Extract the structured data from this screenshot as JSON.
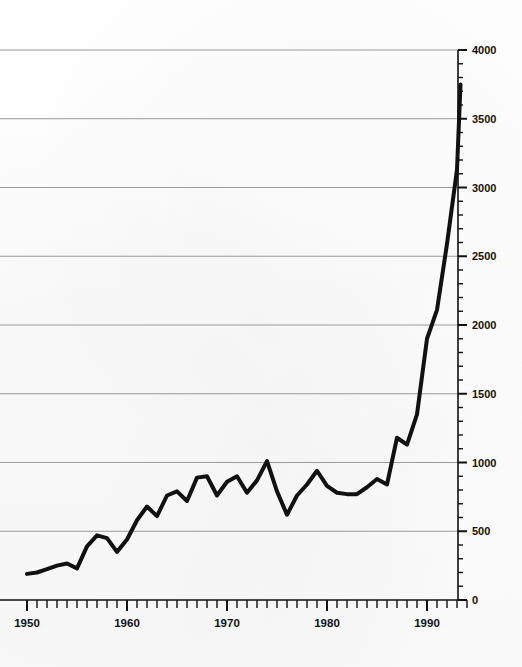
{
  "chart_data": {
    "type": "line",
    "title": "",
    "subtitle": "",
    "xlabel": "",
    "ylabel": "",
    "xlim": [
      1949.5,
      1994.5
    ],
    "ylim": [
      0,
      4000
    ],
    "grid": true,
    "legend": "none",
    "y_ticks_major": [
      0,
      500,
      1000,
      1500,
      2000,
      2500,
      3000,
      3500,
      4000
    ],
    "y_tick_labels": [
      "0",
      "500",
      "1000",
      "1500",
      "2000",
      "2500",
      "3000",
      "3500",
      "4000"
    ],
    "y_minor_step": 100,
    "x_ticks_major": [
      1950,
      1960,
      1970,
      1980,
      1990
    ],
    "x_tick_labels": [
      "1950",
      "1960",
      "1970",
      "1980",
      "1990"
    ],
    "x_minor_step": 1,
    "x_tick_range": [
      1950,
      1994
    ],
    "series": [
      {
        "name": "series-1",
        "color": "#111111",
        "line_width": 4,
        "x": [
          1950,
          1951,
          1952,
          1953,
          1954,
          1955,
          1956,
          1957,
          1958,
          1959,
          1960,
          1961,
          1962,
          1963,
          1964,
          1965,
          1966,
          1967,
          1968,
          1969,
          1970,
          1971,
          1972,
          1973,
          1974,
          1975,
          1976,
          1977,
          1978,
          1979,
          1980,
          1981,
          1982,
          1983,
          1984,
          1985,
          1986,
          1987,
          1988,
          1989,
          1990,
          1991,
          1992,
          1993
        ],
        "values": [
          190,
          200,
          225,
          250,
          265,
          230,
          390,
          470,
          450,
          350,
          440,
          580,
          680,
          610,
          760,
          790,
          720,
          890,
          900,
          760,
          860,
          900,
          780,
          870,
          1010,
          790,
          620,
          760,
          840,
          940,
          830,
          780,
          770,
          770,
          820,
          880,
          840,
          1180,
          1130,
          1350,
          1900,
          2110,
          2590,
          3130
        ]
      }
    ],
    "note_points": {
      "start": {
        "year": 1950,
        "value": 190
      },
      "end": {
        "year": 1993,
        "value": 3750
      },
      "peak_pre1980": {
        "year": 1974,
        "value": 1010
      },
      "trough_1976": {
        "year": 1976,
        "value": 620
      }
    }
  },
  "axes": {
    "y_axis_name": "y-axis",
    "x_axis_name": "x-axis"
  }
}
